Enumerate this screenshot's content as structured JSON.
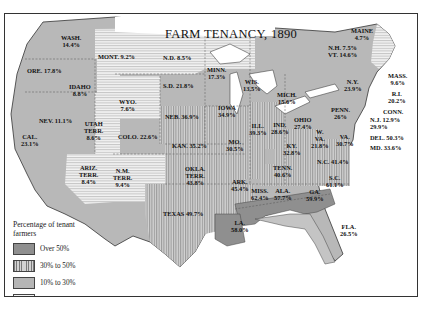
{
  "title": "FARM TENANCY, 1890",
  "legend": {
    "title": "Percentage of tenant farmers",
    "items": [
      {
        "label": "Over 50%",
        "pattern": "dark-solid",
        "color": "#8f8f8f"
      },
      {
        "label": "30% to 50%",
        "pattern": "vertical-lines",
        "color": "#bdbdbd"
      },
      {
        "label": "10% to 30%",
        "pattern": "light-solid",
        "color": "#b5b5b5"
      },
      {
        "label": "Under 10%",
        "pattern": "horizontal-lines",
        "color": "#e8e8e8"
      }
    ]
  },
  "states": [
    {
      "name": "WASH.",
      "value": "14.4%"
    },
    {
      "name": "ORE.",
      "value": "17.8%"
    },
    {
      "name": "CAL.",
      "value": "23.1%"
    },
    {
      "name": "NEV.",
      "value": "11.1%"
    },
    {
      "name": "IDAHO",
      "value": "8.8%"
    },
    {
      "name": "MONT.",
      "value": "9.2%"
    },
    {
      "name": "WYO.",
      "value": "7.6%"
    },
    {
      "name": "UTAH TERR.",
      "value": "8.6%"
    },
    {
      "name": "COLO.",
      "value": "22.6%"
    },
    {
      "name": "ARIZ. TERR.",
      "value": "8.4%"
    },
    {
      "name": "N.M. TERR.",
      "value": "9.4%"
    },
    {
      "name": "N.D.",
      "value": "8.5%"
    },
    {
      "name": "S.D.",
      "value": "21.8%"
    },
    {
      "name": "NEB.",
      "value": "36.9%"
    },
    {
      "name": "KAN.",
      "value": "35.2%"
    },
    {
      "name": "OKLA. TERR.",
      "value": "43.8%"
    },
    {
      "name": "TEXAS",
      "value": "49.7%"
    },
    {
      "name": "MINN.",
      "value": "17.3%"
    },
    {
      "name": "IOWA",
      "value": "34.9%"
    },
    {
      "name": "MO.",
      "value": "30.5%"
    },
    {
      "name": "ARK.",
      "value": "45.4%"
    },
    {
      "name": "LA.",
      "value": "58.0%"
    },
    {
      "name": "WIS.",
      "value": "13.5%"
    },
    {
      "name": "ILL.",
      "value": "39.3%"
    },
    {
      "name": "MICH.",
      "value": "15.6%"
    },
    {
      "name": "IND.",
      "value": "28.6%"
    },
    {
      "name": "OHIO",
      "value": "27.4%"
    },
    {
      "name": "KY.",
      "value": "32.8%"
    },
    {
      "name": "TENN.",
      "value": "40.6%"
    },
    {
      "name": "MISS.",
      "value": "62.4%"
    },
    {
      "name": "ALA.",
      "value": "57.7%"
    },
    {
      "name": "GA.",
      "value": "59.9%"
    },
    {
      "name": "FLA.",
      "value": "26.5%"
    },
    {
      "name": "S.C.",
      "value": "61.1%"
    },
    {
      "name": "N.C.",
      "value": "41.4%"
    },
    {
      "name": "VA.",
      "value": "30.7%"
    },
    {
      "name": "W. VA.",
      "value": "21.8%"
    },
    {
      "name": "PENN.",
      "value": "26%"
    },
    {
      "name": "N.Y.",
      "value": "23.9%"
    },
    {
      "name": "MAINE",
      "value": "4.7%"
    },
    {
      "name": "N.H.",
      "value": "7.5%"
    },
    {
      "name": "VT.",
      "value": "14.6%"
    },
    {
      "name": "MASS.",
      "value": "9.6%"
    },
    {
      "name": "R.I.",
      "value": "20.2%"
    },
    {
      "name": "CONN.",
      "value": "29.9%"
    },
    {
      "name": "N.J.",
      "value": "12.9%"
    },
    {
      "name": "DEL.",
      "value": "50.3%"
    },
    {
      "name": "MD.",
      "value": "33.6%"
    }
  ],
  "labels": {
    "wash": "WASH.\n14.4%",
    "ore": "ORE. 17.8%",
    "cal": "CAL.\n23.1%",
    "nev": "NEV. 11.1%",
    "idaho": "IDAHO\n8.8%",
    "mont": "MONT. 9.2%",
    "wyo": "WYO.\n7.6%",
    "utah": "UTAH\nTERR.\n8.6%",
    "colo": "COLO. 22.6%",
    "ariz": "ARIZ.\nTERR.\n8.4%",
    "nm": "N.M.\nTERR.\n9.4%",
    "nd": "N.D. 8.5%",
    "sd": "S.D. 21.8%",
    "neb": "NEB. 36.9%",
    "kan": "KAN. 35.2%",
    "okla": "OKLA.\nTERR.\n43.8%",
    "texas": "TEXAS 49.7%",
    "minn": "MINN.\n17.3%",
    "iowa": "IOWA\n34.9%",
    "mo": "MO.\n30.5%",
    "ark": "ARK.\n45.4%",
    "la": "LA.\n58.0%",
    "wis": "WIS.\n13.5%",
    "ill": "ILL.\n39.3%",
    "mich": "MICH.\n15.6%",
    "ind": "IND.\n28.6%",
    "ohio": "OHIO\n27.4%",
    "ky": "KY.\n32.8%",
    "tenn": "TENN.\n40.6%",
    "miss": "MISS.\n62.4%",
    "ala": "ALA.\n57.7%",
    "ga": "GA.\n59.9%",
    "fla": "FLA.\n26.5%",
    "sc": "S.C.\n61.1%",
    "nc": "N.C. 41.4%",
    "va": "VA.\n30.7%",
    "wva": "W.\nVA.\n21.8%",
    "penn": "PENN.\n26%",
    "ny": "N.Y.\n23.9%",
    "maine": "MAINE\n4.7%",
    "nhvt": "N.H. 7.5%\nVT. 14.6%",
    "mass": "MASS.\n9.6%",
    "ri": "R.I.\n20.2%",
    "conn": "CONN.",
    "nj": "N.J. 12.9%\n29.9%",
    "del": "DEL. 50.3%",
    "md": "MD. 33.6%"
  }
}
